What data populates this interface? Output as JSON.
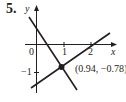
{
  "problem": {
    "number": "5."
  },
  "axes": {
    "x_label": "x",
    "y_label": "y",
    "origin_label": "0",
    "x_ticks": [
      "1",
      "2"
    ],
    "y_ticks": [
      "−1"
    ]
  },
  "intersection": {
    "label": "(0.94, −0.78)",
    "x": 0.94,
    "y": -0.78
  },
  "lines": [
    {
      "name": "decreasing-line",
      "description": "line with negative slope"
    },
    {
      "name": "increasing-line",
      "description": "line with positive slope"
    }
  ],
  "colors": {
    "ink": "#231f20",
    "axis": "#231f20",
    "background": "#ffffff"
  }
}
